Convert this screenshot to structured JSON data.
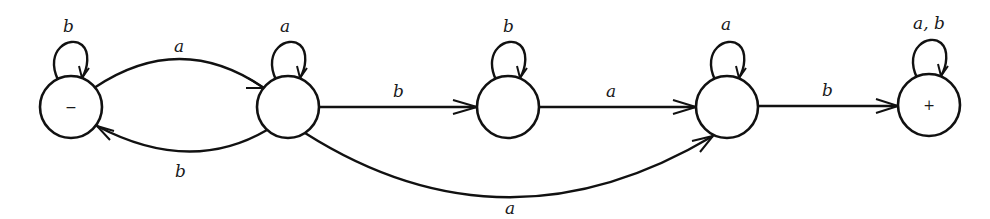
{
  "diagram": {
    "type": "finite-automaton",
    "states": [
      {
        "id": "s1",
        "label": "−",
        "role": "start",
        "cx": 71,
        "cy": 107
      },
      {
        "id": "s2",
        "label": "",
        "cx": 288,
        "cy": 107
      },
      {
        "id": "s3",
        "label": "",
        "cx": 508,
        "cy": 107
      },
      {
        "id": "s4",
        "label": "",
        "cx": 727,
        "cy": 107
      },
      {
        "id": "s5",
        "label": "+",
        "role": "final",
        "cx": 929,
        "cy": 105
      }
    ],
    "transitions": [
      {
        "from": "s1",
        "to": "s1",
        "label": "b"
      },
      {
        "from": "s1",
        "to": "s2",
        "label": "a"
      },
      {
        "from": "s2",
        "to": "s1",
        "label": "b"
      },
      {
        "from": "s2",
        "to": "s2",
        "label": "a"
      },
      {
        "from": "s2",
        "to": "s3",
        "label": "b"
      },
      {
        "from": "s2",
        "to": "s4",
        "label": "a"
      },
      {
        "from": "s3",
        "to": "s3",
        "label": "b"
      },
      {
        "from": "s3",
        "to": "s4",
        "label": "a"
      },
      {
        "from": "s4",
        "to": "s4",
        "label": "a"
      },
      {
        "from": "s4",
        "to": "s5",
        "label": "b"
      },
      {
        "from": "s5",
        "to": "s5",
        "label": "a, b"
      }
    ]
  }
}
